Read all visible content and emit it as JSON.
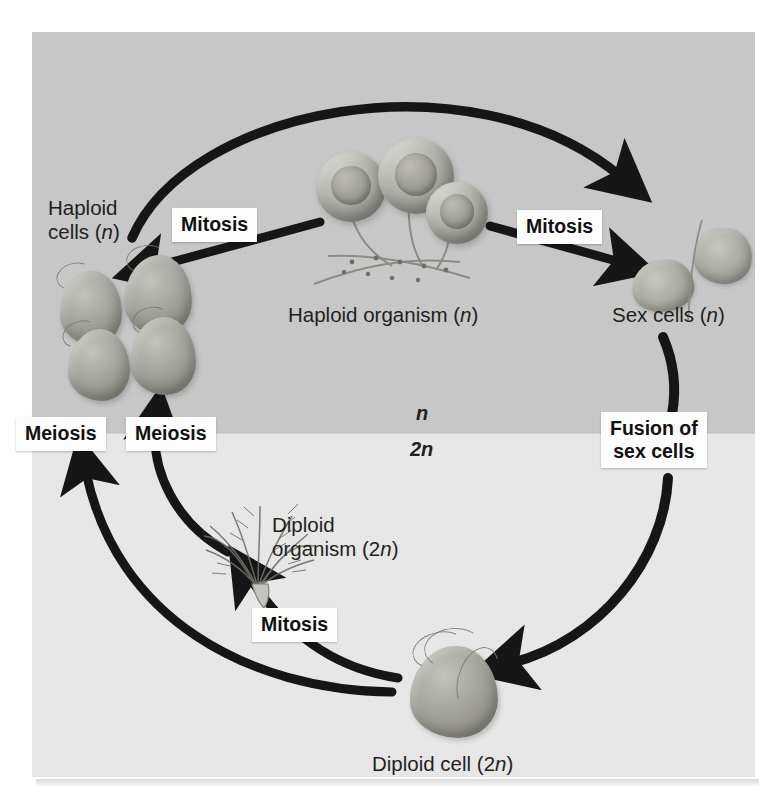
{
  "figure": {
    "type": "biology-life-cycle-diagram",
    "background": {
      "panel_upper_color": "#c9c9c9",
      "panel_lower_color": "#e9e9e9",
      "page_color": "#ffffff",
      "ink_color": "#1a1a1a"
    },
    "ploidy_divider": {
      "upper_label": "n",
      "lower_label": "2n"
    },
    "stage_labels": [
      {
        "id": "haploid-cells",
        "text": "Haploid\ncells (n)",
        "italic_part": "n"
      },
      {
        "id": "haploid-organism",
        "text": "Haploid organism (n)",
        "italic_part": "n"
      },
      {
        "id": "sex-cells",
        "text": "Sex cells (n)",
        "italic_part": "n"
      },
      {
        "id": "diploid-organism",
        "text": "Diploid\norganism (2n)",
        "italic_part": "n"
      },
      {
        "id": "diploid-cell",
        "text": "Diploid cell (2n)",
        "italic_part": "n"
      }
    ],
    "process_labels": [
      {
        "id": "mitosis-top-left",
        "text": "Mitosis"
      },
      {
        "id": "mitosis-top-right",
        "text": "Mitosis"
      },
      {
        "id": "meiosis-left",
        "text": "Meiosis"
      },
      {
        "id": "meiosis-right",
        "text": "Meiosis"
      },
      {
        "id": "fusion-of-sex-cells",
        "text": "Fusion of\nsex cells"
      },
      {
        "id": "mitosis-bottom",
        "text": "Mitosis"
      }
    ],
    "arrows": [
      {
        "id": "arrow-haploid-cells-to-sex-cells",
        "from": "haploid-cells",
        "to": "sex-cells",
        "label": "Mitosis"
      },
      {
        "id": "arrow-haploid-organism-to-cells",
        "from": "haploid-organism",
        "to": "haploid-cells",
        "label": "Mitosis"
      },
      {
        "id": "arrow-haploid-organism-to-sex",
        "from": "haploid-organism",
        "to": "sex-cells",
        "label": "Mitosis"
      },
      {
        "id": "arrow-sex-cells-to-diploid-cell",
        "from": "sex-cells",
        "to": "diploid-cell",
        "label": "Fusion of sex cells"
      },
      {
        "id": "arrow-diploid-cell-to-meiosis-1",
        "from": "diploid-cell",
        "to": "haploid-cells",
        "label": "Meiosis"
      },
      {
        "id": "arrow-diploid-organism-to-meiosis",
        "from": "diploid-organism",
        "to": "haploid-cells",
        "label": "Meiosis"
      },
      {
        "id": "arrow-diploid-cell-to-organism",
        "from": "diploid-cell",
        "to": "diploid-organism",
        "label": "Mitosis"
      }
    ]
  }
}
